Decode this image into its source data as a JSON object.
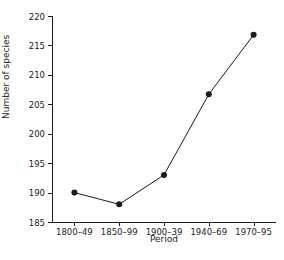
{
  "chart_data": {
    "type": "line",
    "title": "",
    "subtitle": "",
    "categories": [
      "1800–49",
      "1850–99",
      "1900–39",
      "1940–69",
      "1970–95"
    ],
    "values": [
      190,
      188,
      193,
      206.7,
      216.8
    ],
    "xlabel": "Period",
    "ylabel": "Number of species",
    "ylim": [
      185,
      220
    ],
    "yticks": [
      185,
      190,
      195,
      200,
      205,
      210,
      215,
      220
    ],
    "ytick_labels": [
      "185",
      "190",
      "195",
      "200",
      "205",
      "210",
      "215",
      "220"
    ],
    "grid": false,
    "legend": false,
    "legend_position": "none",
    "marker": "filled-circle",
    "line_color": "#1a1a1a",
    "marker_color": "#1a1a1a",
    "background_color": "#ffffff",
    "annotations": []
  }
}
